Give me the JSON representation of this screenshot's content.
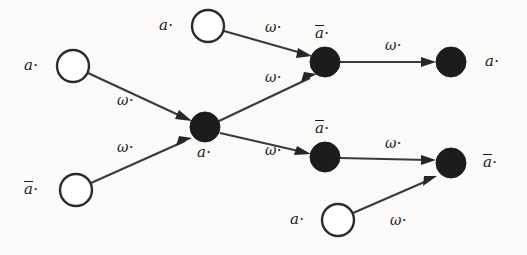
{
  "figure": {
    "kind": "directed-graph",
    "width": 527,
    "height": 255,
    "background_color": "#fbfaf8",
    "node_fill_filled": "#1c1c1c",
    "node_fill_hollow": "#ffffff",
    "node_stroke": "#2b2b2b",
    "edge_color": "#3a3a3a"
  },
  "nodes": [
    {
      "id": "n1",
      "label": "a",
      "overline": false,
      "marker": "·",
      "filled": false,
      "cx": 73,
      "cy": 66,
      "r": 16,
      "label_pos": "left"
    },
    {
      "id": "n2",
      "label": "a",
      "overline": true,
      "marker": "·",
      "filled": false,
      "cx": 76,
      "cy": 190,
      "r": 16,
      "label_pos": "left"
    },
    {
      "id": "n3",
      "label": "a",
      "overline": false,
      "marker": "·",
      "filled": false,
      "cx": 208,
      "cy": 26,
      "r": 16,
      "label_pos": "left"
    },
    {
      "id": "n4",
      "label": "a",
      "overline": false,
      "marker": "·",
      "filled": true,
      "cx": 205,
      "cy": 127,
      "r": 15,
      "label_pos": "below-right"
    },
    {
      "id": "n5",
      "label": "a",
      "overline": true,
      "marker": "·",
      "filled": true,
      "cx": 325,
      "cy": 62,
      "r": 15,
      "label_pos": "above"
    },
    {
      "id": "n6",
      "label": "a",
      "overline": true,
      "marker": "·",
      "filled": true,
      "cx": 325,
      "cy": 157,
      "r": 15,
      "label_pos": "above"
    },
    {
      "id": "n7",
      "label": "a",
      "overline": false,
      "marker": "·",
      "filled": true,
      "cx": 451,
      "cy": 62,
      "r": 15,
      "label_pos": "right"
    },
    {
      "id": "n8",
      "label": "a",
      "overline": true,
      "marker": "·",
      "filled": true,
      "cx": 451,
      "cy": 163,
      "r": 15,
      "label_pos": "right"
    },
    {
      "id": "n9",
      "label": "a",
      "overline": false,
      "marker": "·",
      "filled": false,
      "cx": 338,
      "cy": 220,
      "r": 16,
      "label_pos": "left"
    }
  ],
  "edges": [
    {
      "id": "e1",
      "from": "n1",
      "to": "n4",
      "label": "ω",
      "marker": "·",
      "label_x": 117,
      "label_y": 93
    },
    {
      "id": "e2",
      "from": "n2",
      "to": "n4",
      "label": "ω",
      "marker": "·",
      "label_x": 117,
      "label_y": 140
    },
    {
      "id": "e3",
      "from": "n3",
      "to": "n5",
      "label": "ω",
      "marker": "·",
      "label_x": 265,
      "label_y": 20
    },
    {
      "id": "e4",
      "from": "n4",
      "to": "n5",
      "label": "ω",
      "marker": "·",
      "label_x": 265,
      "label_y": 70
    },
    {
      "id": "e5",
      "from": "n4",
      "to": "n6",
      "label": "ω",
      "marker": "·",
      "label_x": 265,
      "label_y": 143
    },
    {
      "id": "e6",
      "from": "n5",
      "to": "n7",
      "label": "ω",
      "marker": "·",
      "label_x": 385,
      "label_y": 38
    },
    {
      "id": "e7",
      "from": "n6",
      "to": "n8",
      "label": "ω",
      "marker": "·",
      "label_x": 385,
      "label_y": 136
    },
    {
      "id": "e8",
      "from": "n9",
      "to": "n8",
      "label": "ω",
      "marker": "·",
      "label_x": 390,
      "label_y": 213
    }
  ],
  "node_labels": {
    "n1": "a",
    "n2": "a",
    "n3": "a",
    "n4": "a",
    "n5": "a",
    "n6": "a",
    "n7": "a",
    "n8": "a",
    "n9": "a"
  }
}
